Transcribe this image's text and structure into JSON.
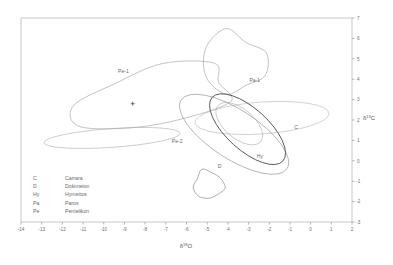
{
  "chart_data": {
    "type": "scatter",
    "title": "",
    "xlabel": "δ¹⁸O",
    "ylabel": "δ¹³C",
    "xlabel_base": "δ",
    "xlabel_sup": "18",
    "xlabel_tail": "O",
    "ylabel_base": "δ",
    "ylabel_sup": "13",
    "ylabel_tail": "C",
    "xlim": [
      -14,
      2
    ],
    "ylim": [
      -3,
      7
    ],
    "grid": false,
    "legend_position": "inside-lower-left",
    "xticks": [
      "-14",
      "-13",
      "-12",
      "-11",
      "-10",
      "-9",
      "-8",
      "-7",
      "-6",
      "-5",
      "-4",
      "-3",
      "-2",
      "-1",
      "0",
      "1",
      "2"
    ],
    "xtick_values": [
      -14,
      -13,
      -12,
      -11,
      -10,
      -9,
      -8,
      -7,
      -6,
      -5,
      -4,
      -3,
      -2,
      -1,
      0,
      1,
      2
    ],
    "yticks": [
      "7",
      "6",
      "5",
      "4",
      "3",
      "2",
      "1",
      "0",
      "-1",
      "-2",
      "-3"
    ],
    "ytick_values": [
      7,
      6,
      5,
      4,
      3,
      2,
      1,
      0,
      -1,
      -2,
      -3
    ],
    "annotations": [
      {
        "label": "Pe-1",
        "x": -9.05,
        "y": 4.3
      },
      {
        "label": "Pe-2",
        "x": -6.45,
        "y": 0.85
      },
      {
        "label": "Pa-1",
        "x": -2.7,
        "y": 3.85
      },
      {
        "label": "C",
        "x": -0.7,
        "y": 1.55
      },
      {
        "label": "Hy",
        "x": -2.45,
        "y": 0.12
      },
      {
        "label": "D",
        "x": -4.4,
        "y": -0.35
      }
    ],
    "data_point_markers": [
      {
        "name": "pentelikon-centroid",
        "x": -8.6,
        "y": 2.8,
        "marker": "plus"
      }
    ],
    "ellipses": [
      {
        "group": "Pe-1",
        "name": "pentelikon-group-1",
        "cx": -7.55,
        "cy": 3.12,
        "rx": 3.95,
        "ry": 1.42,
        "rotation": -13,
        "stroke": "#9b9b9b",
        "stroke_width": 0.55,
        "shape": "blob"
      },
      {
        "group": "Pe-2",
        "name": "pentelikon-group-2",
        "cx": -9.6,
        "cy": 1.12,
        "rx": 3.3,
        "ry": 0.46,
        "rotation": -4,
        "stroke": "#a6a6a6",
        "stroke_width": 0.55,
        "shape": "ellipse"
      },
      {
        "group": "Pa-1",
        "name": "paros-group-1",
        "cx": -3.75,
        "cy": 4.82,
        "rx": 1.55,
        "ry": 1.45,
        "rotation": 22,
        "stroke": "#9b9b9b",
        "stroke_width": 0.55,
        "shape": "blob"
      },
      {
        "group": "C",
        "name": "carrara-group",
        "cx": -2.35,
        "cy": 2.1,
        "rx": 3.25,
        "ry": 0.78,
        "rotation": -4,
        "stroke": "#b0b0b0",
        "stroke_width": 0.55,
        "shape": "ellipse"
      },
      {
        "group": "D",
        "name": "dokimeion-group-main",
        "cx": -3.7,
        "cy": 1.3,
        "rx": 3.05,
        "ry": 1.2,
        "rotation": 33,
        "stroke": "#8f8f8f",
        "stroke_width": 0.6,
        "shape": "ellipse"
      },
      {
        "group": "Hy",
        "name": "hymettos-group",
        "cx": -3.05,
        "cy": 1.55,
        "rx": 2.3,
        "ry": 1.02,
        "rotation": 42,
        "stroke": "#4a4a4a",
        "stroke_width": 0.85,
        "shape": "ellipse"
      },
      {
        "group": "Hy-inner",
        "name": "hymettos-group-inner",
        "cx": -3.45,
        "cy": 1.82,
        "rx": 1.35,
        "ry": 0.72,
        "rotation": 40,
        "stroke": "#9e9e9e",
        "stroke_width": 0.5,
        "shape": "ellipse"
      },
      {
        "group": "D-small",
        "name": "dokimeion-group-small",
        "cx": -4.95,
        "cy": -1.18,
        "rx": 0.72,
        "ry": 0.68,
        "rotation": 10,
        "stroke": "#7d7d7d",
        "stroke_width": 0.6,
        "shape": "blob"
      }
    ]
  },
  "legend": {
    "entries": [
      {
        "key": "C",
        "name": "Carrara"
      },
      {
        "key": "D",
        "name": "Dokimeion"
      },
      {
        "key": "Hy",
        "name": "Hymettos"
      },
      {
        "key": "Pa",
        "name": "Paros"
      },
      {
        "key": "Pe",
        "name": "Pentelikon"
      }
    ]
  },
  "style": {
    "frame_color": "#b9b9b9",
    "tick_color": "#9a9a9a",
    "text_color": "#6a6a6a",
    "background": "#ffffff"
  }
}
